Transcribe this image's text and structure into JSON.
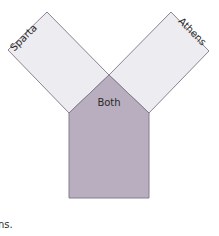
{
  "diagram": {
    "type": "Y-shaped comparison organizer",
    "left_arm": {
      "label": "Sparta",
      "fill": "#edecf0"
    },
    "right_arm": {
      "label": "Athens",
      "fill": "#edecf0"
    },
    "center": {
      "label": "Both",
      "fill": "#b8aebf"
    },
    "stroke_color": "#8c8293"
  },
  "caption": {
    "text": "ns."
  }
}
